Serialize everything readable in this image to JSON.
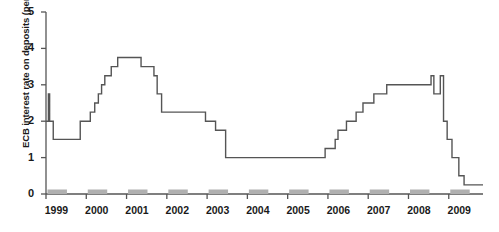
{
  "chart_data": {
    "type": "line",
    "title": "",
    "subtitle": "",
    "xlabel": "",
    "ylabel": "ECB interest rate on deposits (per cent)",
    "ylim": [
      0,
      5
    ],
    "xlim": [
      1999.0,
      2009.85
    ],
    "yticks": [
      0,
      1,
      2,
      3,
      4,
      5
    ],
    "ytick_labels": [
      "0",
      "1",
      "2",
      "3",
      "4",
      "5"
    ],
    "xticks": [
      1999,
      2000,
      2001,
      2002,
      2003,
      2004,
      2005,
      2006,
      2007,
      2008,
      2009
    ],
    "xtick_labels": [
      "1999",
      "2000",
      "2001",
      "2002",
      "2003",
      "2004",
      "2005",
      "2006",
      "2007",
      "2008",
      "2009"
    ],
    "grid": false,
    "legend": null,
    "line_color": "#555555",
    "axis_color": "#555555",
    "marker_band_color": "#b0b0b0",
    "step_type": "post",
    "series": [
      {
        "name": "ECB deposit facility rate",
        "x": [
          1999.0,
          1999.06,
          1999.09,
          1999.18,
          1999.85,
          2000.1,
          2000.21,
          2000.3,
          2000.38,
          2000.46,
          2000.62,
          2000.78,
          2001.36,
          2001.68,
          2001.76,
          2001.87,
          2002.96,
          2003.21,
          2003.46,
          2005.93,
          2006.18,
          2006.25,
          2006.46,
          2006.7,
          2006.87,
          2007.14,
          2007.46,
          2008.56,
          2008.63,
          2008.79,
          2008.87,
          2008.96,
          2009.08,
          2009.25,
          2009.38
        ],
        "y": [
          2.0,
          2.75,
          2.0,
          1.5,
          2.0,
          2.25,
          2.5,
          2.75,
          3.0,
          3.25,
          3.5,
          3.75,
          3.5,
          3.25,
          2.75,
          2.25,
          2.0,
          1.75,
          1.0,
          1.25,
          1.5,
          1.75,
          2.0,
          2.25,
          2.5,
          2.75,
          3.0,
          3.25,
          2.75,
          3.25,
          2.0,
          1.5,
          1.0,
          0.5,
          0.25
        ]
      }
    ]
  }
}
